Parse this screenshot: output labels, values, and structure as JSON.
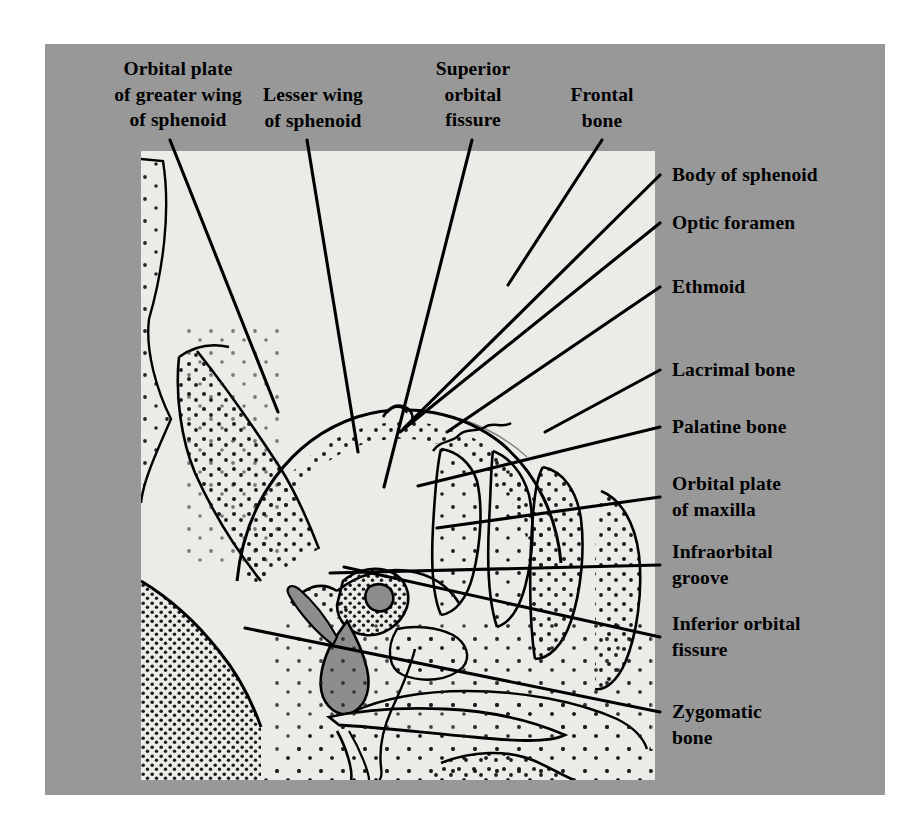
{
  "figure": {
    "type": "anatomical-illustration",
    "panel_background_color": "#989898",
    "illustration_background_color": "#ebebe8",
    "line_color": "#000000",
    "aperture_fill_color": "#8d8d8d"
  },
  "labels": {
    "orbital_plate_greater_wing": "Orbital plate\nof greater wing\nof sphenoid",
    "lesser_wing": "Lesser wing\nof sphenoid",
    "superior_orbital_fissure": "Superior\norbital\nfissure",
    "frontal_bone": "Frontal\nbone",
    "body_of_sphenoid": "Body of sphenoid",
    "optic_foramen": "Optic foramen",
    "ethmoid": "Ethmoid",
    "lacrimal_bone": "Lacrimal bone",
    "palatine_bone": "Palatine bone",
    "orbital_plate_maxilla": "Orbital plate\nof maxilla",
    "infraorbital_groove": "Infraorbital\ngroove",
    "inferior_orbital_fissure": "Inferior orbital\nfissure",
    "zygomatic_bone": "Zygomatic\nbone"
  },
  "structures": [
    {
      "name": "Orbital plate of greater wing of sphenoid",
      "position": "lateral orbital wall, upper"
    },
    {
      "name": "Lesser wing of sphenoid",
      "position": "orbital roof, medial to superior orbital fissure"
    },
    {
      "name": "Superior orbital fissure",
      "position": "orbital apex, between greater and lesser wings"
    },
    {
      "name": "Frontal bone",
      "position": "orbital roof"
    },
    {
      "name": "Body of sphenoid",
      "position": "orbital apex, medial"
    },
    {
      "name": "Optic foramen",
      "position": "apex of orbit, within lesser wing"
    },
    {
      "name": "Ethmoid",
      "position": "medial orbital wall"
    },
    {
      "name": "Lacrimal bone",
      "position": "anterior medial wall"
    },
    {
      "name": "Palatine bone",
      "position": "posterior orbital floor, medial"
    },
    {
      "name": "Orbital plate of maxilla",
      "position": "orbital floor"
    },
    {
      "name": "Infraorbital groove",
      "position": "orbital floor, running anteriorly"
    },
    {
      "name": "Inferior orbital fissure",
      "position": "between lateral wall and floor"
    },
    {
      "name": "Zygomatic bone",
      "position": "inferolateral orbital margin"
    }
  ]
}
